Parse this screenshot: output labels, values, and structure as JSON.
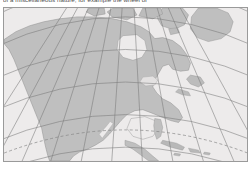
{
  "caption": {
    "text": "of a miscellaneous nature, for example the wheel or"
  },
  "figure": {
    "projection": "Lambert conformal conic",
    "frame": {
      "x": 3,
      "y": 7,
      "width": 245,
      "height": 155
    }
  },
  "map": {
    "ocean_color": "#e8e6e6",
    "land_color": "#b9b9b9",
    "coast_color": "#8f8f8f",
    "graticule_color": "#6f6f6f",
    "tropic_color": "#7d7d7d",
    "frame_color": "#9a9a9a",
    "graticule": {
      "meridian_spacing_deg": 15,
      "parallel_spacing_deg": 15,
      "meridian_labels": [
        "150W",
        "135W",
        "120W",
        "105W",
        "90W",
        "75W",
        "60W",
        "45W",
        "30W"
      ],
      "parallel_labels": [
        "15N",
        "30N",
        "45N",
        "60N",
        "75N"
      ],
      "style": "solid"
    },
    "special_lines": [
      {
        "name": "Tropic of Cancer",
        "latitude_deg": 23.5,
        "style": "dashed"
      }
    ],
    "features": [
      "Greenland",
      "Canadian Arctic Archipelago",
      "Hudson Bay",
      "Canada",
      "United States",
      "Great Lakes",
      "Gulf of Mexico",
      "Mexico",
      "Baja California",
      "Florida",
      "Cuba",
      "Caribbean islands",
      "Central America",
      "Newfoundland",
      "Alaska",
      "Pacific Ocean",
      "Atlantic Ocean"
    ]
  }
}
